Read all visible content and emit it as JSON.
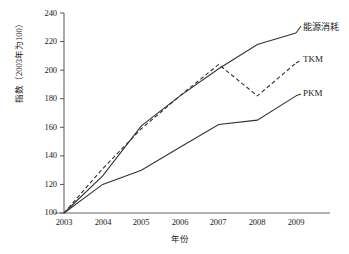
{
  "chart_data": {
    "type": "line",
    "title": "",
    "xlabel": "年份",
    "ylabel": "指数（2003年为100）",
    "x": [
      2003,
      2004,
      2005,
      2006,
      2007,
      2008,
      2009
    ],
    "categories": [
      "2003",
      "2004",
      "2005",
      "2006",
      "2007",
      "2008",
      "2009"
    ],
    "xlim": [
      2003,
      2009
    ],
    "ylim": [
      100,
      240
    ],
    "yticks": [
      100,
      120,
      140,
      160,
      180,
      200,
      220,
      240
    ],
    "grid": false,
    "legend_position": "right-of-axes",
    "series": [
      {
        "name": "能源消耗",
        "style": "solid",
        "color": "#333333",
        "values": [
          100,
          126,
          161,
          182,
          201,
          218,
          226
        ]
      },
      {
        "name": "TKM",
        "style": "dashed",
        "color": "#333333",
        "values": [
          100,
          131,
          159,
          182,
          204,
          182,
          205
        ]
      },
      {
        "name": "PKM",
        "style": "solid",
        "color": "#333333",
        "values": [
          100,
          120,
          130,
          146,
          162,
          165,
          182
        ]
      }
    ]
  },
  "axes": {
    "ytick_labels": [
      "240",
      "220",
      "200",
      "180",
      "160",
      "140",
      "120",
      "100"
    ],
    "xtick_labels": [
      "2003",
      "2004",
      "2005",
      "2006",
      "2007",
      "2008",
      "2009"
    ],
    "ylabel": "指数（2003年为100）",
    "xlabel": "年份"
  },
  "legend": {
    "items": [
      {
        "label": "能源消耗"
      },
      {
        "label": "TKM"
      },
      {
        "label": "PKM"
      }
    ]
  }
}
